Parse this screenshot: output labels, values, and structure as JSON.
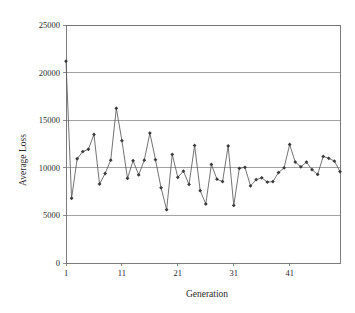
{
  "chart_data": {
    "type": "line",
    "title": "",
    "xlabel": "Generation",
    "ylabel": "Average Loss",
    "xlim": [
      1,
      50
    ],
    "ylim": [
      0,
      25000
    ],
    "grid": true,
    "legend": "none",
    "marker": "diamond",
    "line_color": "#5a5a5a",
    "marker_color": "#3a3a3a",
    "gridline_color": "#8c8c8c",
    "frame_color": "#6e6e6e",
    "background_color": "#ffffff",
    "y_ticks": [
      0,
      5000,
      10000,
      15000,
      20000,
      25000
    ],
    "y_tick_labels": [
      "0",
      "5000",
      "10000",
      "15000",
      "20000",
      "25000"
    ],
    "x_ticks": [
      1,
      11,
      21,
      31,
      41
    ],
    "x_tick_labels": [
      "1",
      "11",
      "21",
      "31",
      "41"
    ],
    "x": [
      1,
      2,
      3,
      4,
      5,
      6,
      7,
      8,
      9,
      10,
      11,
      12,
      13,
      14,
      15,
      16,
      17,
      18,
      19,
      20,
      21,
      22,
      23,
      24,
      25,
      26,
      27,
      28,
      29,
      30,
      31,
      32,
      33,
      34,
      35,
      36,
      37,
      38,
      39,
      40,
      41,
      42,
      43,
      44,
      45,
      46,
      47,
      48,
      49,
      50
    ],
    "values": [
      21200,
      6800,
      10950,
      11700,
      11950,
      13500,
      8300,
      9400,
      10800,
      16250,
      12850,
      8900,
      10750,
      9250,
      10800,
      13650,
      10850,
      7900,
      5600,
      11400,
      9000,
      9650,
      8250,
      12350,
      7600,
      6200,
      10350,
      8800,
      8550,
      12300,
      6050,
      9950,
      10050,
      8100,
      8750,
      8950,
      8500,
      8550,
      9500,
      10000,
      12450,
      10600,
      10100,
      10600,
      9800,
      9300,
      11200,
      11000,
      10700,
      9600
    ],
    "series_name": "Average Loss"
  },
  "axis": {
    "y_title": "Average Loss",
    "x_title": "Generation"
  }
}
